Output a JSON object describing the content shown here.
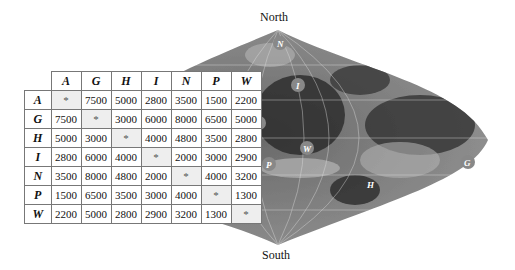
{
  "poles": {
    "north": "North",
    "south": "South"
  },
  "table": {
    "columns": [
      "A",
      "G",
      "H",
      "I",
      "N",
      "P",
      "W"
    ],
    "rows": [
      {
        "label": "A",
        "values": [
          "*",
          "7500",
          "5000",
          "2800",
          "3500",
          "1500",
          "2200"
        ]
      },
      {
        "label": "G",
        "values": [
          "7500",
          "*",
          "3000",
          "6000",
          "8000",
          "6500",
          "5000"
        ]
      },
      {
        "label": "H",
        "values": [
          "5000",
          "3000",
          "*",
          "4000",
          "4800",
          "3500",
          "2800"
        ]
      },
      {
        "label": "I",
        "values": [
          "2800",
          "6000",
          "4000",
          "*",
          "2000",
          "3000",
          "2900"
        ]
      },
      {
        "label": "N",
        "values": [
          "3500",
          "8000",
          "4800",
          "2000",
          "*",
          "4000",
          "3200"
        ]
      },
      {
        "label": "P",
        "values": [
          "1500",
          "6500",
          "3500",
          "3000",
          "4000",
          "*",
          "1300"
        ]
      },
      {
        "label": "W",
        "values": [
          "2200",
          "5000",
          "2800",
          "2900",
          "3200",
          "1300",
          "*"
        ]
      }
    ]
  },
  "map_labels": [
    {
      "id": "N",
      "text": "N",
      "x": 280,
      "y": 46
    },
    {
      "id": "I",
      "text": "I",
      "x": 298,
      "y": 86
    },
    {
      "id": "A",
      "text": "A",
      "x": 258,
      "y": 123
    },
    {
      "id": "W",
      "text": "W",
      "x": 307,
      "y": 149
    },
    {
      "id": "P",
      "text": "P",
      "x": 269,
      "y": 164
    },
    {
      "id": "H",
      "text": "H",
      "x": 370,
      "y": 184
    },
    {
      "id": "G",
      "text": "G",
      "x": 468,
      "y": 163
    }
  ]
}
